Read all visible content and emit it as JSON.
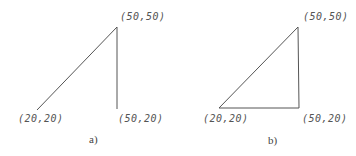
{
  "figures": [
    {
      "caption": "a)",
      "points": {
        "top": "(50,50)",
        "bottom_left": "(20,20)",
        "bottom_right": "(50,20)"
      },
      "closed": false
    },
    {
      "caption": "b)",
      "points": {
        "top": "(50,50)",
        "bottom_left": "(20,20)",
        "bottom_right": "(50,20)"
      },
      "closed": true
    }
  ],
  "colors": {
    "line": "#555555",
    "text": "#555555"
  }
}
